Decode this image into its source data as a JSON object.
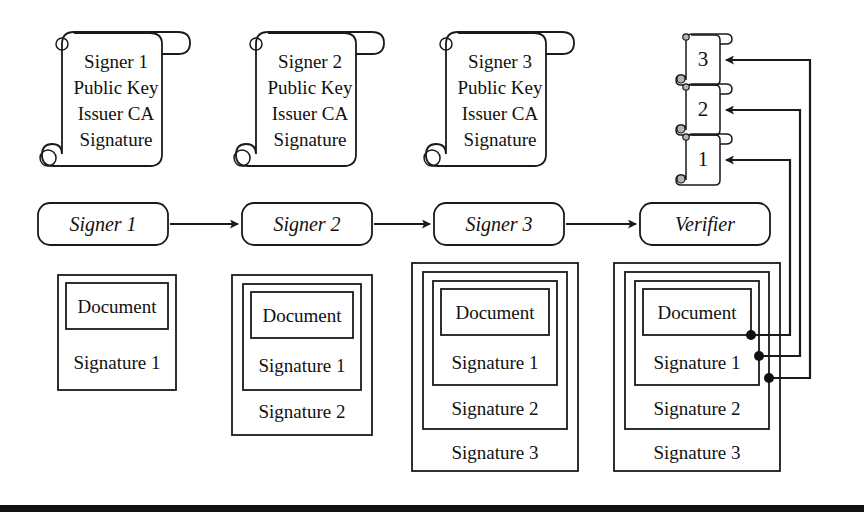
{
  "diagram": {
    "colors": {
      "gray_fill": "#c6c6c6",
      "white_fill": "#ffffff",
      "stroke": "#1a1a1a",
      "rule": "#111111"
    },
    "certificates": [
      {
        "id": "cert-1",
        "lines": [
          "Signer 1",
          "Public Key",
          "Issuer CA",
          "Signature"
        ]
      },
      {
        "id": "cert-2",
        "lines": [
          "Signer 2",
          "Public Key",
          "Issuer CA",
          "Signature"
        ]
      },
      {
        "id": "cert-3",
        "lines": [
          "Signer 3",
          "Public Key",
          "Issuer CA",
          "Signature"
        ]
      }
    ],
    "numbered_scrolls": [
      {
        "id": "scroll-3",
        "label": "3"
      },
      {
        "id": "scroll-2",
        "label": "2"
      },
      {
        "id": "scroll-1",
        "label": "1"
      }
    ],
    "actors": [
      {
        "id": "actor-signer-1",
        "label": "Signer 1"
      },
      {
        "id": "actor-signer-2",
        "label": "Signer 2"
      },
      {
        "id": "actor-signer-3",
        "label": "Signer 3"
      },
      {
        "id": "actor-verifier",
        "label": "Verifier"
      }
    ],
    "document_label": "Document",
    "stacks": [
      {
        "id": "stack-1",
        "signatures": [
          "Signature 1"
        ]
      },
      {
        "id": "stack-2",
        "signatures": [
          "Signature 1",
          "Signature 2"
        ]
      },
      {
        "id": "stack-3",
        "signatures": [
          "Signature 1",
          "Signature 2",
          "Signature 3"
        ]
      },
      {
        "id": "stack-4",
        "signatures": [
          "Signature 1",
          "Signature 2",
          "Signature 3"
        ]
      }
    ]
  }
}
